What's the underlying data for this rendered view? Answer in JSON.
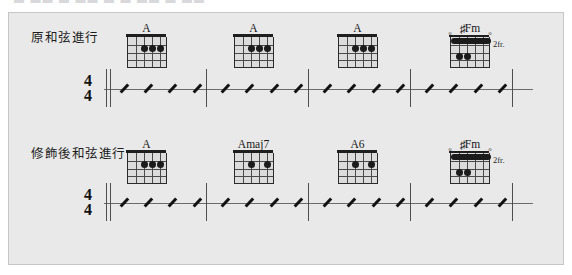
{
  "scan": {
    "top_sliver_text": "▬ ▬▬ ▬ ▬▬ ▬ ▬ ▬▬ ▬ ▬▬"
  },
  "systems": [
    {
      "id": "system-1",
      "label": "原和弦進行",
      "time_signature": {
        "numerator": "4",
        "denominator": "4"
      },
      "chords": [
        {
          "name": "A",
          "accidental": "",
          "fret_label": "",
          "position_fret": 1,
          "markers": [
            "",
            "",
            "",
            "",
            "",
            ""
          ],
          "dots": [
            {
              "string": 4,
              "fret": 2
            },
            {
              "string": 3,
              "fret": 2
            },
            {
              "string": 2,
              "fret": 2
            }
          ],
          "barre": null
        },
        {
          "name": "A",
          "accidental": "",
          "fret_label": "",
          "position_fret": 1,
          "markers": [
            "",
            "",
            "",
            "",
            "",
            ""
          ],
          "dots": [
            {
              "string": 4,
              "fret": 2
            },
            {
              "string": 3,
              "fret": 2
            },
            {
              "string": 2,
              "fret": 2
            }
          ],
          "barre": null
        },
        {
          "name": "A",
          "accidental": "",
          "fret_label": "",
          "position_fret": 1,
          "markers": [
            "",
            "",
            "",
            "",
            "",
            ""
          ],
          "dots": [
            {
              "string": 4,
              "fret": 2
            },
            {
              "string": 3,
              "fret": 2
            },
            {
              "string": 2,
              "fret": 2
            }
          ],
          "barre": null
        },
        {
          "name": "Fm",
          "accidental": "♯",
          "fret_label": "2fr.",
          "position_fret": 2,
          "markers": [
            "o",
            "",
            "",
            "",
            "",
            "o"
          ],
          "dots": [
            {
              "string": 5,
              "fret": 3
            },
            {
              "string": 4,
              "fret": 3
            }
          ],
          "barre": {
            "fret": 1,
            "from_string": 6,
            "to_string": 1
          }
        }
      ],
      "measures": [
        {
          "slashes": 4
        },
        {
          "slashes": 4
        },
        {
          "slashes": 4
        },
        {
          "slashes": 4
        }
      ]
    },
    {
      "id": "system-2",
      "label": "修飾後和弦進行",
      "time_signature": {
        "numerator": "4",
        "denominator": "4"
      },
      "chords": [
        {
          "name": "A",
          "accidental": "",
          "fret_label": "",
          "position_fret": 1,
          "markers": [
            "",
            "",
            "",
            "",
            "",
            ""
          ],
          "dots": [
            {
              "string": 4,
              "fret": 2
            },
            {
              "string": 3,
              "fret": 2
            },
            {
              "string": 2,
              "fret": 2
            }
          ],
          "barre": null
        },
        {
          "name": "Amaj7",
          "accidental": "",
          "fret_label": "",
          "position_fret": 1,
          "markers": [
            "",
            "",
            "",
            "",
            "",
            ""
          ],
          "dots": [
            {
              "string": 4,
              "fret": 2
            },
            {
              "string": 2,
              "fret": 2
            }
          ],
          "barre": null
        },
        {
          "name": "A6",
          "accidental": "",
          "fret_label": "",
          "position_fret": 1,
          "markers": [
            "",
            "",
            "",
            "",
            "",
            ""
          ],
          "dots": [
            {
              "string": 4,
              "fret": 2
            },
            {
              "string": 2,
              "fret": 2
            }
          ],
          "barre": null
        },
        {
          "name": "Fm",
          "accidental": "♯",
          "fret_label": "2fr.",
          "position_fret": 2,
          "markers": [
            "o",
            "",
            "",
            "",
            "",
            "o"
          ],
          "dots": [
            {
              "string": 5,
              "fret": 3
            },
            {
              "string": 4,
              "fret": 3
            }
          ],
          "barre": {
            "fret": 1,
            "from_string": 6,
            "to_string": 1
          }
        }
      ],
      "measures": [
        {
          "slashes": 4
        },
        {
          "slashes": 4
        },
        {
          "slashes": 4
        },
        {
          "slashes": 4
        }
      ]
    }
  ],
  "colors": {
    "panel_background": "#e9e9e9",
    "panel_border": "#c6c6c6",
    "ink": "#1b1b1b",
    "staff_line": "#6b6b6b",
    "page_background": "#ffffff"
  },
  "layout": {
    "chord_x_positions": [
      105,
      212,
      316,
      428
    ],
    "barline_x_positions": [
      97,
      197,
      299,
      401,
      503
    ],
    "measure_count": 4,
    "strings": 6,
    "frets": 4
  }
}
